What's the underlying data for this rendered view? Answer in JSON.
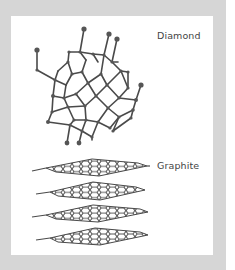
{
  "figure": {
    "labels": {
      "diamond": "Diamond",
      "graphite": "Graphite"
    },
    "colors": {
      "frame": "#d6d6d6",
      "panel": "#ffffff",
      "bonds": "#4a4a4a",
      "atoms": "#555555",
      "text": "#444444"
    },
    "structures": [
      {
        "name": "Diamond",
        "type": "3D tetrahedral carbon lattice"
      },
      {
        "name": "Graphite",
        "type": "stacked hexagonal carbon sheets",
        "layers": 4
      }
    ]
  }
}
